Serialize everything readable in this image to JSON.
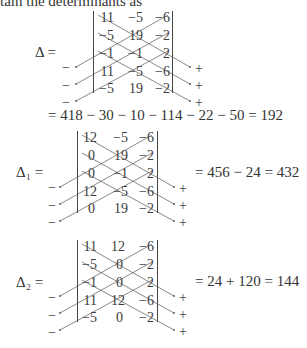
{
  "intro_text": "tain the determinants as",
  "blocks": [
    {
      "label": "Δ =",
      "matrix": [
        [
          "11",
          "−5",
          "−6"
        ],
        [
          "−5",
          "19",
          "−2"
        ],
        [
          "−1",
          "−1",
          "2"
        ],
        [
          "11",
          "−5",
          "−6"
        ],
        [
          "−5",
          "19",
          "−2"
        ]
      ],
      "minus_signs": [
        "−",
        "−",
        "−"
      ],
      "plus_signs": [
        "+",
        "+",
        "+"
      ],
      "result_line": "= 418 − 30 − 10 − 114 − 22 − 50 = 192",
      "inline_result": ""
    },
    {
      "label": "Δ₁ =",
      "matrix": [
        [
          "12",
          "−5",
          "−6"
        ],
        [
          "0",
          "19",
          "−2"
        ],
        [
          "0",
          "−1",
          "2"
        ],
        [
          "12",
          "−5",
          "−6"
        ],
        [
          "0",
          "19",
          "−2"
        ]
      ],
      "minus_signs": [
        "−",
        "−",
        "−"
      ],
      "plus_signs": [
        "+",
        "+",
        "+"
      ],
      "result_line": "",
      "inline_result": "= 456 − 24 = 432"
    },
    {
      "label": "Δ₂ =",
      "matrix": [
        [
          "11",
          "12",
          "−6"
        ],
        [
          "−5",
          "0",
          "−2"
        ],
        [
          "−1",
          "0",
          "2"
        ],
        [
          "11",
          "12",
          "−6"
        ],
        [
          "−5",
          "0",
          "−2"
        ]
      ],
      "minus_signs": [
        "−",
        "−",
        "−"
      ],
      "plus_signs": [
        "+",
        "+",
        "+"
      ],
      "result_line": "",
      "inline_result": "= 24 + 120 = 144"
    }
  ]
}
